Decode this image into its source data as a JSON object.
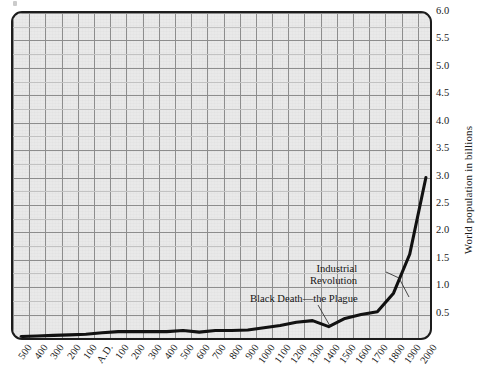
{
  "chart_data": {
    "type": "line",
    "title": "",
    "xlabel": "",
    "ylabel": "World population in billions",
    "ylim": [
      0.0,
      6.0
    ],
    "y_ticks": [
      "0.5",
      "1.0",
      "1.5",
      "2.0",
      "2.5",
      "3.0",
      "3.5",
      "4.0",
      "4.5",
      "5.0",
      "5.5",
      "6.0"
    ],
    "y_tick_values": [
      0.5,
      1.0,
      1.5,
      2.0,
      2.5,
      3.0,
      3.5,
      4.0,
      4.5,
      5.0,
      5.5,
      6.0
    ],
    "grid": true,
    "legend": "none",
    "x_tick_labels": [
      "500",
      "400",
      "300",
      "200",
      "100",
      "A.D.",
      "100",
      "200",
      "300",
      "400",
      "500",
      "600",
      "700",
      "800",
      "900",
      "1000",
      "1100",
      "1200",
      "1300",
      "1400",
      "1500",
      "1600",
      "1700",
      "1800",
      "1900",
      "2000"
    ],
    "x_values": [
      -500,
      -400,
      -300,
      -200,
      -100,
      0,
      100,
      200,
      300,
      400,
      500,
      600,
      700,
      800,
      900,
      1000,
      1100,
      1200,
      1300,
      1400,
      1500,
      1600,
      1700,
      1800,
      1900,
      2000
    ],
    "series": [
      {
        "name": "World population",
        "values": [
          0.1,
          0.11,
          0.12,
          0.13,
          0.14,
          0.17,
          0.19,
          0.19,
          0.19,
          0.19,
          0.21,
          0.18,
          0.21,
          0.21,
          0.22,
          0.26,
          0.3,
          0.36,
          0.39,
          0.28,
          0.43,
          0.5,
          0.55,
          0.89,
          1.6,
          3.0
        ]
      }
    ],
    "annotations": [
      {
        "id": "industrial-revolution",
        "text_line_1": "Industrial",
        "text_line_2": "Revolution",
        "points_to_year": 1800
      },
      {
        "id": "black-death",
        "text": "Black Death—the Plague",
        "points_to_year": 1400
      }
    ],
    "colors": {
      "line": "#111111",
      "plot_background": "#e9e9e9",
      "frame": "#1c1c1c",
      "grid_major": "#8d8d8d",
      "grid_minor": "#c2c2c2"
    }
  }
}
